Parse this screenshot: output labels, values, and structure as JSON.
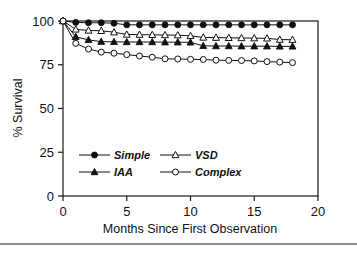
{
  "chart_data": {
    "type": "line",
    "title": "",
    "xlabel": "Months Since First Observation",
    "ylabel": "% Survival",
    "xlim": [
      0,
      20
    ],
    "ylim": [
      0,
      100
    ],
    "xticks": [
      0,
      5,
      10,
      15,
      20
    ],
    "yticks": [
      0,
      25,
      50,
      75,
      100
    ],
    "xtick_labels": [
      "0",
      "5",
      "10",
      "15",
      "20"
    ],
    "ytick_labels": [
      "0",
      "25",
      "50",
      "75",
      "100"
    ],
    "grid": false,
    "legend_position": "lower-left-inside",
    "x": [
      0,
      1,
      2,
      3,
      4,
      5,
      6,
      7,
      8,
      9,
      10,
      11,
      12,
      13,
      14,
      15,
      16,
      17,
      18
    ],
    "series": [
      {
        "name": "Simple",
        "marker": "filled-circle",
        "values": [
          100,
          99.2,
          99.0,
          99.0,
          98.7,
          97.8,
          97.8,
          97.8,
          97.8,
          97.8,
          97.8,
          97.8,
          97.8,
          97.8,
          97.8,
          97.8,
          97.8,
          97.8,
          97.8
        ]
      },
      {
        "name": "VSD",
        "marker": "open-triangle",
        "values": [
          100,
          95.2,
          94.6,
          94.4,
          93.6,
          92.3,
          92.2,
          92.1,
          92.0,
          91.9,
          91.5,
          90.6,
          90.5,
          90.4,
          90.3,
          90.2,
          90.1,
          89.4,
          89.3
        ]
      },
      {
        "name": "IAA",
        "marker": "filled-triangle",
        "values": [
          100,
          91.0,
          89.2,
          88.2,
          88.1,
          88.0,
          88.0,
          88.0,
          87.9,
          87.9,
          87.8,
          85.8,
          85.7,
          85.7,
          85.6,
          85.6,
          85.6,
          85.5,
          85.5
        ]
      },
      {
        "name": "Complex",
        "marker": "open-circle",
        "values": [
          100,
          87.2,
          84.0,
          82.2,
          81.6,
          80.8,
          80.0,
          79.3,
          78.4,
          78.3,
          78.1,
          78.0,
          77.6,
          77.5,
          77.4,
          77.2,
          76.8,
          76.5,
          76.2
        ]
      }
    ]
  },
  "legend": {
    "entries": [
      {
        "label": "Simple",
        "marker": "filled-circle"
      },
      {
        "label": "VSD",
        "marker": "open-triangle"
      },
      {
        "label": "IAA",
        "marker": "filled-triangle"
      },
      {
        "label": "Complex",
        "marker": "open-circle"
      }
    ]
  },
  "colors": {
    "ink": "#111111",
    "background": "#ffffff",
    "rule": "#8a8a8a"
  }
}
